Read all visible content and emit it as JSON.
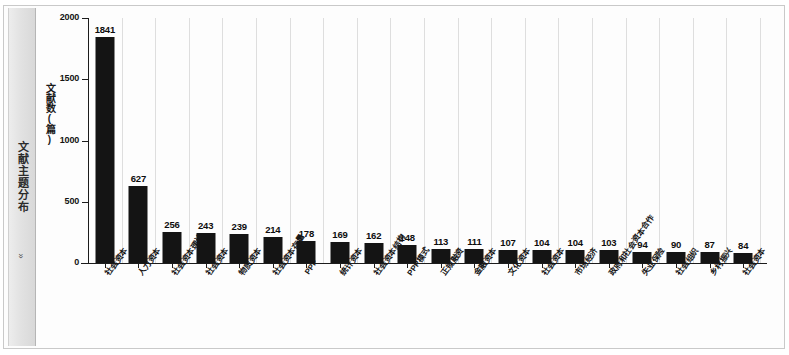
{
  "side_tab": {
    "label": "文献主题分布",
    "chevron": "»"
  },
  "chart_data": {
    "type": "bar",
    "title": "",
    "xlabel": "",
    "ylabel": "文献数(篇)",
    "ylim": [
      0,
      2000
    ],
    "yticks": [
      0,
      500,
      1000,
      1500,
      2000
    ],
    "ytick_labels": [
      "0",
      "500",
      "1000",
      "1500",
      "2000"
    ],
    "grid": "vertical",
    "legend": "none",
    "bar_color": "#141414",
    "categories": [
      "社会资本",
      "人力资本",
      "社会资本理论",
      "社会资本",
      "物质资本",
      "社会资本存量",
      "PPP",
      "统计资本",
      "社会资本结构",
      "PPP模式",
      "正规融资",
      "金融资本",
      "文化资本",
      "社会资本",
      "市场经济",
      "政府和社会资本合作",
      "失业保险",
      "社会组织",
      "乡村振兴",
      "社会资本"
    ],
    "values": [
      1841,
      627,
      256,
      243,
      239,
      214,
      178,
      169,
      162,
      148,
      113,
      111,
      107,
      104,
      104,
      103,
      94,
      90,
      87,
      84
    ],
    "value_labels": [
      "1841",
      "627",
      "256",
      "243",
      "239",
      "214",
      "178",
      "169",
      "162",
      "148",
      "113",
      "111",
      "107",
      "104",
      "104",
      "103",
      "94",
      "90",
      "87",
      "84"
    ]
  }
}
